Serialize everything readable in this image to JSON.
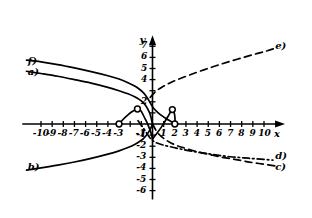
{
  "chart_data": {
    "type": "line",
    "title": "",
    "xlabel": "x",
    "ylabel": "y",
    "xlim": [
      -11.5,
      11.8
    ],
    "ylim": [
      -6.8,
      7.9
    ],
    "grid": false,
    "legend_position": "inline-curve-ends",
    "x_ticks": [
      -10,
      -9,
      -8,
      -7,
      -6,
      -5,
      -4,
      -3,
      -2,
      -1,
      1,
      2,
      3,
      4,
      5,
      6,
      7,
      8,
      9,
      10
    ],
    "x_tick_labels": [
      "-10",
      "-9",
      "-8",
      "-7",
      "-6",
      "-5",
      "-4",
      "-3",
      "",
      "-1",
      "1",
      "2",
      "3",
      "4",
      "5",
      "6",
      "7",
      "8",
      "9",
      "10"
    ],
    "y_ticks": [
      7,
      6,
      5,
      4,
      3,
      2,
      1,
      -1,
      -2,
      -3,
      -4,
      -5,
      -6
    ],
    "y_tick_labels": [
      "7",
      "6",
      "5",
      "4",
      "",
      "2",
      "",
      "-1",
      "-2",
      "-3",
      "-4",
      "-5",
      "-6"
    ],
    "series": [
      {
        "name": "a)",
        "label": "a)",
        "style": "solid",
        "label_x": -11.0,
        "label_y": 4.55,
        "points": [
          [
            -11.3,
            4.75
          ],
          [
            -10.0,
            4.55
          ],
          [
            -8.5,
            4.3
          ],
          [
            -7.0,
            4.0
          ],
          [
            -5.5,
            3.68
          ],
          [
            -4.0,
            3.3
          ],
          [
            -3.0,
            3.0
          ],
          [
            -2.2,
            2.72
          ],
          [
            -1.6,
            2.45
          ],
          [
            -1.2,
            2.22
          ],
          [
            -0.85,
            1.95
          ],
          [
            -0.6,
            1.65
          ],
          [
            -0.4,
            1.3
          ],
          [
            -0.22,
            0.9
          ],
          [
            -0.1,
            0.45
          ],
          [
            0.0,
            0.0
          ]
        ]
      },
      {
        "name": "b)",
        "label": "b)",
        "style": "solid",
        "label_x": -11.0,
        "label_y": -3.95,
        "points": [
          [
            -11.3,
            -4.15
          ],
          [
            -10.0,
            -3.95
          ],
          [
            -8.5,
            -3.7
          ],
          [
            -7.0,
            -3.42
          ],
          [
            -5.5,
            -3.1
          ],
          [
            -4.0,
            -2.72
          ],
          [
            -3.0,
            -2.42
          ],
          [
            -2.2,
            -2.12
          ],
          [
            -1.6,
            -1.85
          ],
          [
            -1.2,
            -1.6
          ],
          [
            -0.85,
            -1.35
          ],
          [
            -0.6,
            -1.08
          ],
          [
            -0.4,
            -0.8
          ],
          [
            -0.22,
            -0.5
          ],
          [
            -0.1,
            -0.25
          ],
          [
            0.0,
            0.0
          ]
        ]
      },
      {
        "name": "c)",
        "label": "c)",
        "style": "dashed",
        "label_x": 11.1,
        "label_y": -4.0,
        "points": [
          [
            0.0,
            0.0
          ],
          [
            0.3,
            -0.55
          ],
          [
            0.6,
            -0.95
          ],
          [
            1.0,
            -1.3
          ],
          [
            1.5,
            -1.62
          ],
          [
            2.2,
            -1.95
          ],
          [
            3.0,
            -2.2
          ],
          [
            4.0,
            -2.5
          ],
          [
            5.0,
            -2.72
          ],
          [
            6.0,
            -2.95
          ],
          [
            7.0,
            -3.12
          ],
          [
            8.0,
            -3.3
          ],
          [
            9.0,
            -3.48
          ],
          [
            10.0,
            -3.62
          ],
          [
            11.0,
            -3.78
          ]
        ]
      },
      {
        "name": "d)",
        "label": "d)",
        "style": "dashdot",
        "label_x": 11.1,
        "label_y": -3.0,
        "points": [
          [
            -1.3,
            0.3
          ],
          [
            -0.9,
            -0.25
          ],
          [
            -0.5,
            -0.85
          ],
          [
            -0.2,
            -1.28
          ],
          [
            0.2,
            -1.62
          ],
          [
            0.8,
            -1.85
          ],
          [
            1.6,
            -2.05
          ],
          [
            2.5,
            -2.25
          ],
          [
            3.5,
            -2.45
          ],
          [
            4.6,
            -2.62
          ],
          [
            5.8,
            -2.8
          ],
          [
            7.0,
            -2.95
          ],
          [
            8.2,
            -3.05
          ],
          [
            9.4,
            -3.15
          ],
          [
            10.8,
            -3.25
          ]
        ]
      },
      {
        "name": "e)",
        "label": "e)",
        "style": "dashed",
        "label_x": 11.1,
        "label_y": 6.95,
        "points": [
          [
            -0.2,
            2.4
          ],
          [
            0.3,
            2.95
          ],
          [
            0.9,
            3.35
          ],
          [
            1.6,
            3.72
          ],
          [
            2.5,
            4.1
          ],
          [
            3.5,
            4.48
          ],
          [
            4.6,
            4.88
          ],
          [
            5.7,
            5.25
          ],
          [
            6.8,
            5.6
          ],
          [
            8.0,
            5.95
          ],
          [
            9.2,
            6.3
          ],
          [
            10.3,
            6.6
          ],
          [
            11.2,
            6.9
          ]
        ]
      },
      {
        "name": "f)",
        "label": "f)",
        "style": "solid",
        "label_x": -11.0,
        "label_y": 5.6,
        "points": [
          [
            -11.3,
            5.75
          ],
          [
            -10.0,
            5.6
          ],
          [
            -8.5,
            5.35
          ],
          [
            -7.0,
            5.05
          ],
          [
            -5.5,
            4.72
          ],
          [
            -4.0,
            4.35
          ],
          [
            -3.0,
            4.05
          ],
          [
            -2.2,
            3.72
          ],
          [
            -1.6,
            3.42
          ],
          [
            -1.2,
            3.15
          ],
          [
            -0.85,
            2.85
          ],
          [
            -0.6,
            2.55
          ],
          [
            -0.4,
            2.25
          ],
          [
            -0.2,
            1.9
          ],
          [
            0.0,
            1.55
          ],
          [
            0.3,
            1.2
          ],
          [
            0.7,
            0.85
          ],
          [
            1.2,
            0.5
          ],
          [
            1.7,
            0.2
          ],
          [
            2.0,
            0.0
          ]
        ]
      },
      {
        "name": "inner-arc-left",
        "label": "",
        "style": "solid",
        "points": [
          [
            -3.0,
            0.0
          ],
          [
            -2.6,
            0.45
          ],
          [
            -2.2,
            0.82
          ],
          [
            -1.85,
            1.1
          ],
          [
            -1.55,
            1.28
          ],
          [
            -1.35,
            1.35
          ],
          [
            -1.15,
            1.3
          ],
          [
            -1.0,
            1.12
          ],
          [
            -0.85,
            0.85
          ],
          [
            -0.68,
            0.5
          ],
          [
            -0.48,
            0.1
          ],
          [
            -0.3,
            -0.35
          ],
          [
            -0.12,
            -0.85
          ],
          [
            0.0,
            -1.35
          ]
        ]
      },
      {
        "name": "inner-arc-right",
        "label": "",
        "style": "solid",
        "points": [
          [
            0.0,
            -1.35
          ],
          [
            0.35,
            -0.9
          ],
          [
            0.75,
            -0.35
          ],
          [
            1.1,
            0.2
          ],
          [
            1.4,
            0.7
          ],
          [
            1.62,
            1.08
          ],
          [
            1.78,
            1.3
          ],
          [
            1.9,
            1.18
          ],
          [
            1.98,
            0.85
          ],
          [
            2.02,
            0.45
          ],
          [
            2.0,
            0.0
          ]
        ]
      }
    ],
    "markers": [
      {
        "name": "open-point-x-neg3",
        "x": -3.0,
        "y": 0.0,
        "type": "open-circle"
      },
      {
        "name": "open-point-left-peak",
        "x": -1.35,
        "y": 1.35,
        "type": "open-circle"
      },
      {
        "name": "open-point-right-peak",
        "x": 1.78,
        "y": 1.3,
        "type": "open-circle"
      },
      {
        "name": "open-point-x-2",
        "x": 2.0,
        "y": 0.0,
        "type": "open-circle"
      }
    ]
  },
  "axes": {
    "x_axis_name": "x",
    "y_axis_name": "y"
  }
}
